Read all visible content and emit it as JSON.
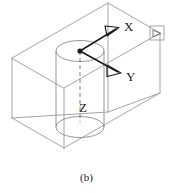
{
  "figure": {
    "caption": "(b)",
    "line_color": "#8a8a8a",
    "edge_color": "#9a9a9a",
    "axis_color": "#1a1a1a",
    "text_color": "#1a1a1a",
    "background": "#ffffff"
  },
  "axes": {
    "x": {
      "label": "X",
      "direction": "upper-right",
      "arrow": "open"
    },
    "y": {
      "label": "Y",
      "direction": "lower-right",
      "arrow": "open"
    },
    "z": {
      "label": "Z",
      "direction": "down",
      "style": "dashed"
    }
  },
  "annotations": {
    "corner_marker": "detail-square",
    "origin": "axis-origin-point"
  }
}
